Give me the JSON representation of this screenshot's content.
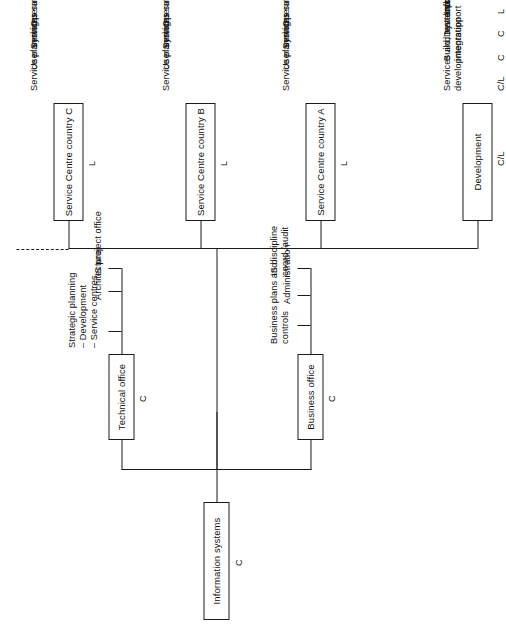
{
  "diagram": {
    "root": {
      "label": "Information systems",
      "code": "C"
    },
    "branches": [
      {
        "label": "Technical office",
        "code": "C",
        "items": [
          "Strategic planning\n– Development\n– Service centres",
          "Architecture",
          "IS project office"
        ]
      },
      {
        "label": "Business office",
        "code": "C",
        "items": [
          "Business plans and\ncontrols",
          "Administration",
          "IS discipline\ncoord /audit"
        ]
      }
    ],
    "service_centres": [
      {
        "label": "Service Centre country\nC",
        "code": "L",
        "items": [
          "Service planning",
          "User services",
          "Systems support",
          "Operations"
        ]
      },
      {
        "label": "Service Centre country\nB",
        "code": "L",
        "items": [
          "Service planning",
          "User services",
          "Systems support",
          "Operations"
        ]
      },
      {
        "label": "Service Centre country\nA",
        "code": "L",
        "items": [
          "Service planning",
          "User services",
          "Systems support",
          "Operations"
        ]
      }
    ],
    "development": {
      "label": "Development",
      "code": "C/L",
      "rows": [
        {
          "code": "C/L",
          "text": "Services and systems\ndevelopment"
        },
        {
          "code": "C",
          "text": "Build, test and\nintegration"
        },
        {
          "code": "C",
          "text": "Development\nsupport"
        },
        {
          "code": "L",
          "text": "Information centre"
        }
      ]
    },
    "continuation_marker": "dashed-line-more-countries",
    "colors": {
      "line": "#1a1a1a",
      "text": "#111111",
      "background": "#ffffff"
    }
  }
}
